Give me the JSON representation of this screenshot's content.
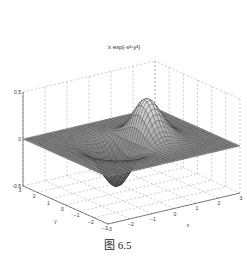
{
  "title": "x exp(-x²-y²)",
  "caption": "图 6.5",
  "chart_data": {
    "type": "surface",
    "function": "z = x*exp(-x^2-y^2)",
    "xlabel": "x",
    "ylabel": "y",
    "zlabel": "",
    "xlim": [
      -3,
      3
    ],
    "ylim": [
      -3,
      3
    ],
    "zlim": [
      -0.5,
      0.5
    ],
    "x_ticks": [
      -3,
      -2,
      -1,
      0,
      1,
      2,
      3
    ],
    "y_ticks": [
      -3,
      -2,
      -1,
      0,
      1,
      2,
      3
    ],
    "z_ticks": [
      -0.5,
      0,
      0.5
    ],
    "z_tick_labels": [
      "-0.5",
      "0",
      "0.5"
    ],
    "grid": true,
    "colormap": "gray mesh",
    "peak": {
      "x": 0.707,
      "y": 0,
      "z": 0.429
    },
    "trough": {
      "x": -0.707,
      "y": 0,
      "z": -0.429
    }
  }
}
